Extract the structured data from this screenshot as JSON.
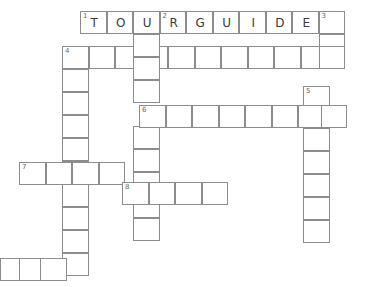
{
  "puzzle": {
    "title": "Crossword Grid",
    "type": "crossword",
    "grid_origin_x": 0,
    "grid_origin_y": 0,
    "cell_width": 26.5,
    "cell_height": 23,
    "background_color": "#ffffff",
    "cell_border_color": "#8c8c8c",
    "letter_color": "#3a3a3a",
    "number_color": "#6a6a6a",
    "entries": [
      {
        "number": "1",
        "direction": "across",
        "answer_shown": "TOURGUIDE",
        "length": 9,
        "start_x": 80,
        "start_y": 11,
        "letters": [
          "T",
          "O",
          "U",
          "R",
          "G",
          "U",
          "I",
          "D",
          "E"
        ]
      },
      {
        "number": "2",
        "direction": "down",
        "answer_shown": "R",
        "length": 10,
        "start_x": 133,
        "start_y": 11,
        "letters": [
          "R",
          "",
          "",
          "",
          "",
          "",
          "",
          "",
          "",
          ""
        ]
      },
      {
        "number": "3",
        "direction": "down",
        "answer_shown": "",
        "length": 3,
        "start_x": 286,
        "start_y": 11,
        "letters": [
          "",
          "",
          ""
        ]
      },
      {
        "number": "4",
        "direction": "across",
        "answer_shown": "",
        "length": 10,
        "start_x": 62,
        "start_y": 46,
        "letters": [
          "",
          "",
          "",
          "",
          "",
          "",
          "",
          "",
          "",
          ""
        ]
      },
      {
        "number": "4",
        "direction": "down",
        "answer_shown": "",
        "length": 10,
        "start_x": 62,
        "start_y": 46,
        "letters": [
          "",
          "",
          "",
          "",
          "",
          "",
          "",
          "",
          "",
          ""
        ]
      },
      {
        "number": "5",
        "direction": "down",
        "answer_shown": "",
        "length": 7,
        "start_x": 303,
        "start_y": 86,
        "letters": [
          "",
          "",
          "",
          "",
          "",
          "",
          ""
        ]
      },
      {
        "number": "6",
        "direction": "across",
        "answer_shown": "",
        "length": 8,
        "start_x": 139,
        "start_y": 105,
        "letters": [
          "",
          "",
          "",
          "",
          "",
          "",
          "",
          ""
        ]
      },
      {
        "number": "7",
        "direction": "across",
        "answer_shown": "",
        "length": 4,
        "start_x": 19,
        "start_y": 162,
        "letters": [
          "",
          "",
          "",
          ""
        ]
      },
      {
        "number": "8",
        "direction": "across",
        "answer_shown": "",
        "length": 4,
        "start_x": 122,
        "start_y": 182,
        "letters": [
          "",
          "",
          "",
          ""
        ]
      },
      {
        "number": "",
        "direction": "across",
        "answer_shown": "",
        "length": 3,
        "start_x": 0,
        "start_y": 258,
        "letters": [
          "",
          "",
          ""
        ]
      }
    ],
    "cells": [
      {
        "name": "cell-r1c1",
        "x": 80,
        "y": 11,
        "num": "1",
        "letter": "T"
      },
      {
        "name": "cell-r1c2",
        "x": 106.5,
        "y": 11,
        "num": "",
        "letter": "O"
      },
      {
        "name": "cell-r1c3",
        "x": 133,
        "y": 11,
        "num": "",
        "letter": "U"
      },
      {
        "name": "cell-r1c4",
        "x": 159.5,
        "y": 11,
        "num": "2",
        "letter": "R"
      },
      {
        "name": "cell-r1c5",
        "x": 186,
        "y": 11,
        "num": "",
        "letter": "G"
      },
      {
        "name": "cell-r1c6",
        "x": 212.5,
        "y": 11,
        "num": "",
        "letter": "U"
      },
      {
        "name": "cell-r1c7",
        "x": 239,
        "y": 11,
        "num": "",
        "letter": "I"
      },
      {
        "name": "cell-r1c8",
        "x": 265.5,
        "y": 11,
        "num": "",
        "letter": "D"
      },
      {
        "name": "cell-r1c9",
        "x": 292,
        "y": 11,
        "num": "",
        "letter": "E"
      },
      {
        "name": "cell-3d-1",
        "x": 318.5,
        "y": 11,
        "num": "3",
        "letter": ""
      },
      {
        "name": "cell-3d-2",
        "x": 318.5,
        "y": 34,
        "num": "",
        "letter": ""
      },
      {
        "name": "cell-r4c1",
        "x": 62,
        "y": 46,
        "num": "4",
        "letter": ""
      },
      {
        "name": "cell-r4c2",
        "x": 88.5,
        "y": 46,
        "num": "",
        "letter": ""
      },
      {
        "name": "cell-r4c3",
        "x": 115,
        "y": 46,
        "num": "",
        "letter": ""
      },
      {
        "name": "cell-r4c4",
        "x": 141.5,
        "y": 46,
        "num": "",
        "letter": ""
      },
      {
        "name": "cell-r4c5",
        "x": 168,
        "y": 46,
        "num": "",
        "letter": ""
      },
      {
        "name": "cell-r4c6",
        "x": 194.5,
        "y": 46,
        "num": "",
        "letter": ""
      },
      {
        "name": "cell-r4c7",
        "x": 221,
        "y": 46,
        "num": "",
        "letter": ""
      },
      {
        "name": "cell-r4c8",
        "x": 247.5,
        "y": 46,
        "num": "",
        "letter": ""
      },
      {
        "name": "cell-r4c9",
        "x": 274,
        "y": 46,
        "num": "",
        "letter": ""
      },
      {
        "name": "cell-r4c10",
        "x": 300.5,
        "y": 46,
        "num": "",
        "letter": ""
      },
      {
        "name": "cell-r4c11",
        "x": 318.5,
        "y": 46,
        "num": "",
        "letter": ""
      },
      {
        "name": "cell-4d-2",
        "x": 62,
        "y": 69,
        "num": "",
        "letter": ""
      },
      {
        "name": "cell-4d-3",
        "x": 62,
        "y": 92,
        "num": "",
        "letter": ""
      },
      {
        "name": "cell-4d-4",
        "x": 62,
        "y": 115,
        "num": "",
        "letter": ""
      },
      {
        "name": "cell-4d-5",
        "x": 62,
        "y": 138,
        "num": "",
        "letter": ""
      },
      {
        "name": "cell-4d-6",
        "x": 62,
        "y": 161,
        "num": "",
        "letter": ""
      },
      {
        "name": "cell-4d-7",
        "x": 62,
        "y": 184,
        "num": "",
        "letter": ""
      },
      {
        "name": "cell-4d-8",
        "x": 62,
        "y": 207,
        "num": "",
        "letter": ""
      },
      {
        "name": "cell-4d-9",
        "x": 62,
        "y": 230,
        "num": "",
        "letter": ""
      },
      {
        "name": "cell-4d-10",
        "x": 62,
        "y": 253,
        "num": "",
        "letter": ""
      },
      {
        "name": "cell-2d-2",
        "x": 133,
        "y": 34,
        "num": "",
        "letter": ""
      },
      {
        "name": "cell-2d-3",
        "x": 133,
        "y": 57,
        "num": "",
        "letter": ""
      },
      {
        "name": "cell-2d-4",
        "x": 133,
        "y": 80,
        "num": "",
        "letter": ""
      },
      {
        "name": "cell-2d-6",
        "x": 133,
        "y": 126,
        "num": "",
        "letter": ""
      },
      {
        "name": "cell-2d-7",
        "x": 133,
        "y": 149,
        "num": "",
        "letter": ""
      },
      {
        "name": "cell-2d-8",
        "x": 133,
        "y": 172,
        "num": "",
        "letter": ""
      },
      {
        "name": "cell-2d-9",
        "x": 133,
        "y": 195,
        "num": "",
        "letter": ""
      },
      {
        "name": "cell-2d-10",
        "x": 133,
        "y": 218,
        "num": "",
        "letter": ""
      },
      {
        "name": "cell-5d-1",
        "x": 303,
        "y": 86,
        "num": "5",
        "letter": ""
      },
      {
        "name": "cell-5d-3",
        "x": 303,
        "y": 128,
        "num": "",
        "letter": ""
      },
      {
        "name": "cell-5d-4",
        "x": 303,
        "y": 151,
        "num": "",
        "letter": ""
      },
      {
        "name": "cell-5d-5",
        "x": 303,
        "y": 174,
        "num": "",
        "letter": ""
      },
      {
        "name": "cell-5d-6",
        "x": 303,
        "y": 197,
        "num": "",
        "letter": ""
      },
      {
        "name": "cell-5d-7",
        "x": 303,
        "y": 220,
        "num": "",
        "letter": ""
      },
      {
        "name": "cell-r6c1",
        "x": 139,
        "y": 105,
        "num": "6",
        "letter": ""
      },
      {
        "name": "cell-r6c2",
        "x": 165.5,
        "y": 105,
        "num": "",
        "letter": ""
      },
      {
        "name": "cell-r6c3",
        "x": 192,
        "y": 105,
        "num": "",
        "letter": ""
      },
      {
        "name": "cell-r6c4",
        "x": 218.5,
        "y": 105,
        "num": "",
        "letter": ""
      },
      {
        "name": "cell-r6c5",
        "x": 245,
        "y": 105,
        "num": "",
        "letter": ""
      },
      {
        "name": "cell-r6c6",
        "x": 271.5,
        "y": 105,
        "num": "",
        "letter": ""
      },
      {
        "name": "cell-r6c7",
        "x": 298,
        "y": 105,
        "num": "",
        "letter": ""
      },
      {
        "name": "cell-r6c8",
        "x": 320.5,
        "y": 105,
        "num": "",
        "letter": ""
      },
      {
        "name": "cell-r7c1",
        "x": 19,
        "y": 162,
        "num": "7",
        "letter": ""
      },
      {
        "name": "cell-r7c2",
        "x": 45.5,
        "y": 162,
        "num": "",
        "letter": ""
      },
      {
        "name": "cell-r7c3",
        "x": 72,
        "y": 162,
        "num": "",
        "letter": ""
      },
      {
        "name": "cell-r7c4",
        "x": 98.5,
        "y": 162,
        "num": "",
        "letter": ""
      },
      {
        "name": "cell-r8c1",
        "x": 122,
        "y": 182,
        "num": "8",
        "letter": ""
      },
      {
        "name": "cell-r8c2",
        "x": 148.5,
        "y": 182,
        "num": "",
        "letter": ""
      },
      {
        "name": "cell-r8c3",
        "x": 175,
        "y": 182,
        "num": "",
        "letter": ""
      },
      {
        "name": "cell-r8c4",
        "x": 201.5,
        "y": 182,
        "num": "",
        "letter": ""
      },
      {
        "name": "cell-bot-1",
        "x": 0,
        "y": 258,
        "num": "",
        "letter": ""
      },
      {
        "name": "cell-bot-2",
        "x": 18.5,
        "y": 258,
        "num": "",
        "letter": ""
      },
      {
        "name": "cell-bot-3",
        "x": 40,
        "y": 258,
        "num": "",
        "letter": ""
      }
    ]
  }
}
